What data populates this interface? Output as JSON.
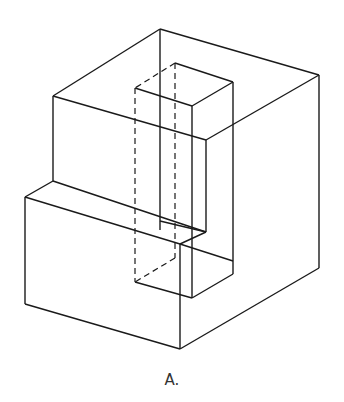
{
  "figure": {
    "label": "A.",
    "stroke_color": "#1a1a1a",
    "solid_edges": [
      [
        160,
        29,
        53,
        96
      ],
      [
        160,
        29,
        319,
        75
      ],
      [
        53,
        96,
        206,
        140
      ],
      [
        319,
        75,
        206,
        140
      ],
      [
        160,
        29,
        160,
        230
      ],
      [
        53,
        96,
        53,
        181
      ],
      [
        53,
        181,
        25,
        197
      ],
      [
        53,
        181,
        206,
        232
      ],
      [
        25,
        197,
        180,
        244
      ],
      [
        25,
        197,
        25,
        304
      ],
      [
        25,
        304,
        180,
        349
      ],
      [
        180,
        349,
        319,
        268
      ],
      [
        319,
        75,
        319,
        268
      ],
      [
        180,
        244,
        180,
        349
      ],
      [
        206,
        140,
        206,
        232
      ],
      [
        206,
        232,
        180,
        244
      ],
      [
        175,
        63,
        233,
        82
      ],
      [
        135,
        88,
        192,
        106
      ],
      [
        233,
        82,
        192,
        106
      ],
      [
        192,
        106,
        192,
        232
      ],
      [
        233,
        82,
        233,
        274
      ],
      [
        135,
        282,
        192,
        298
      ],
      [
        192,
        298,
        233,
        274
      ],
      [
        192,
        232,
        192,
        298
      ],
      [
        160,
        221,
        206,
        232
      ],
      [
        180,
        244,
        233,
        261
      ]
    ],
    "dashed_edges": [
      [
        175,
        63,
        135,
        88
      ],
      [
        135,
        88,
        135,
        282
      ],
      [
        175,
        63,
        175,
        258
      ],
      [
        175,
        258,
        135,
        282
      ]
    ]
  }
}
